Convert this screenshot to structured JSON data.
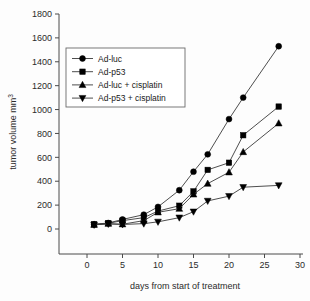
{
  "chart_data": {
    "type": "line",
    "title": "",
    "xlabel": "days from start of treatment",
    "ylabel": "tumor volume mm",
    "ylabel_superscript": "3",
    "xlim": [
      0,
      30
    ],
    "ylim": [
      0,
      1800
    ],
    "xticks": [
      0,
      5,
      10,
      15,
      20,
      25,
      30
    ],
    "yticks": [
      0,
      200,
      400,
      600,
      800,
      1000,
      1200,
      1400,
      1600,
      1800
    ],
    "xtick_labels": [
      "0",
      "5",
      "10",
      "15",
      "20",
      "25",
      "30"
    ],
    "ytick_labels": [
      "0",
      "200",
      "400",
      "600",
      "800",
      "1000",
      "1200",
      "1400",
      "1600",
      "1800"
    ],
    "grid": false,
    "legend_position": "upper-left-inside",
    "marker_color": "#000000",
    "line_color": "#3a3a3a",
    "axis_color": "#4a4a4a",
    "x": [
      1,
      3,
      5,
      8,
      10,
      13,
      15,
      17,
      20,
      22,
      27
    ],
    "series": [
      {
        "name": "Ad-luc",
        "marker": "circle",
        "values": [
          40,
          50,
          80,
          120,
          185,
          325,
          480,
          625,
          920,
          1100,
          1530
        ]
      },
      {
        "name": "Ad-p53",
        "marker": "square",
        "values": [
          38,
          48,
          70,
          95,
          150,
          195,
          315,
          495,
          555,
          785,
          1025
        ]
      },
      {
        "name": "Ad-luc + cisplatin",
        "marker": "triangle-up",
        "values": [
          36,
          45,
          40,
          70,
          140,
          170,
          290,
          380,
          475,
          645,
          885
        ]
      },
      {
        "name": "Ad-p53 + cisplatin",
        "marker": "triangle-down",
        "values": [
          35,
          42,
          38,
          45,
          60,
          95,
          145,
          235,
          275,
          350,
          365
        ]
      }
    ],
    "legend_entries": [
      "Ad-luc",
      "Ad-p53",
      "Ad-luc + cisplatin",
      "Ad-p53 + cisplatin"
    ]
  }
}
